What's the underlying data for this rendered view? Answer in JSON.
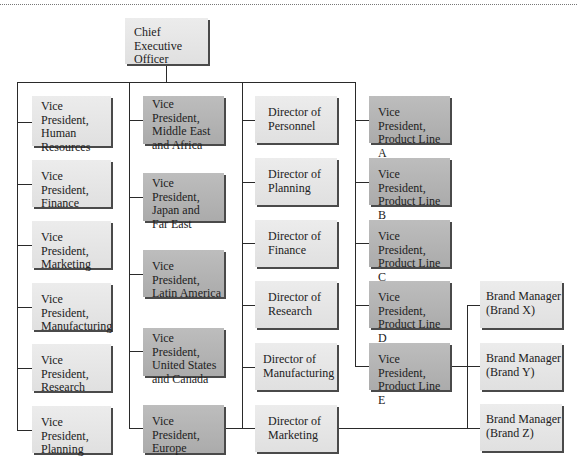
{
  "chart_title": "",
  "ceo": {
    "label": "Chief Executive\nOfficer"
  },
  "columns": [
    {
      "name": "functional-vps",
      "items": [
        {
          "label": "Vice President,\nHuman\nResources"
        },
        {
          "label": "Vice President,\nFinance"
        },
        {
          "label": "Vice President,\nMarketing"
        },
        {
          "label": "Vice President,\nManufacturing"
        },
        {
          "label": "Vice President,\nResearch"
        },
        {
          "label": "Vice President,\nPlanning"
        }
      ]
    },
    {
      "name": "regional-vps",
      "items": [
        {
          "label": "Vice President,\nMiddle East\nand Africa"
        },
        {
          "label": "Vice President,\nJapan and\nFar East"
        },
        {
          "label": "Vice President,\nLatin America"
        },
        {
          "label": "Vice President,\nUnited States\nand Canada"
        },
        {
          "label": "Vice President,\nEurope"
        }
      ]
    },
    {
      "name": "directors",
      "items": [
        {
          "label": "Director of\nPersonnel"
        },
        {
          "label": "Director of\nPlanning"
        },
        {
          "label": "Director of\nFinance"
        },
        {
          "label": "Director of\nResearch"
        },
        {
          "label": "Director of\nManufacturing"
        },
        {
          "label": "Director of\nMarketing"
        }
      ]
    },
    {
      "name": "product-line-vps",
      "items": [
        {
          "label": "Vice President,\nProduct Line A"
        },
        {
          "label": "Vice President,\nProduct Line B"
        },
        {
          "label": "Vice President,\nProduct Line C"
        },
        {
          "label": "Vice President,\nProduct Line D"
        },
        {
          "label": "Vice President,\nProduct Line E"
        }
      ]
    },
    {
      "name": "brand-managers",
      "items": [
        {
          "label": "Brand Manager\n(Brand X)"
        },
        {
          "label": "Brand Manager\n(Brand Y)"
        },
        {
          "label": "Brand Manager\n(Brand Z)"
        }
      ]
    }
  ],
  "colors": {
    "light_box": "#e4e4e4",
    "dark_box": "#b2b2b2",
    "line": "#2a2a2a",
    "shadow": "#4a4a4a"
  }
}
